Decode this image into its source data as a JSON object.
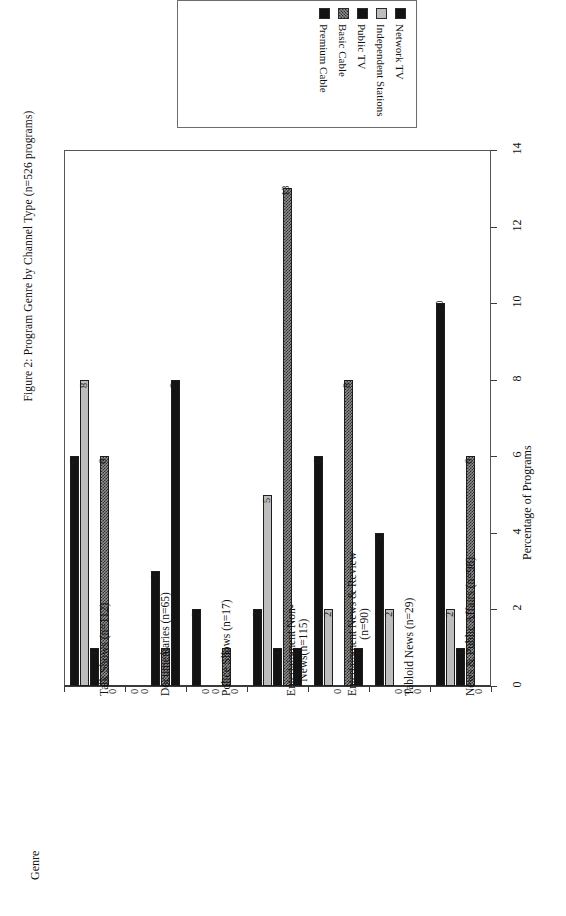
{
  "figure": {
    "title": "Figure 2: Program Genre by Channel Type (n=526 programs)"
  },
  "chart_data": {
    "type": "bar",
    "title": "Figure 2: Program Genre by Channel Type (n=526 programs)",
    "orientation": "vertical-bars-rotated-page",
    "xlabel": "Genre",
    "ylabel": "Percentage of Programs",
    "ylim": [
      0,
      14
    ],
    "yticks": [
      0,
      2,
      4,
      6,
      8,
      10,
      12,
      14
    ],
    "ytick_labels": [
      "0",
      "2",
      "4",
      "6",
      "8",
      "10",
      "12",
      "14"
    ],
    "grid": false,
    "legend_position": "top",
    "categories": [
      "Talk Shows (n=112)",
      "Documentaries (n=65)",
      "Police Shows (n=17)",
      "Entertainment Non-News(n=115)",
      "Entertainment News & Review (n=90)",
      "Tabloid News (n=29)",
      "News & Public Affairs (n=98)"
    ],
    "category_lines": [
      [
        "Talk Shows (n=112)"
      ],
      [
        "Documentaries (n=65)"
      ],
      [
        "Police Shows (n=17)"
      ],
      [
        "Entertainment Non-",
        "News(n=115)"
      ],
      [
        "Entertainment News & Review",
        "(n=90)"
      ],
      [
        "Tabloid News (n=29)"
      ],
      [
        "News & Public Affairs (n=98)"
      ]
    ],
    "series": [
      {
        "name": "Network TV",
        "fill": "black",
        "color": "#131313",
        "values": [
          6,
          0,
          2,
          2,
          6,
          4,
          10
        ]
      },
      {
        "name": "Independent Stations",
        "fill": "light-gray",
        "color": "#bdbdbd",
        "values": [
          8,
          0,
          0,
          5,
          2,
          2,
          2
        ]
      },
      {
        "name": "Public TV",
        "fill": "black",
        "color": "#131313",
        "values": [
          1,
          3,
          0,
          1,
          0,
          0,
          1
        ]
      },
      {
        "name": "Basic Cable",
        "fill": "checker",
        "color": "#8f8f8f",
        "values": [
          6,
          1,
          1,
          13,
          8,
          0,
          6
        ]
      },
      {
        "name": "Premium Cable",
        "fill": "black",
        "color": "#131313",
        "values": [
          0,
          8,
          0,
          1,
          1,
          0,
          0
        ]
      }
    ]
  },
  "legend": {
    "items": [
      {
        "label": "Network TV",
        "swatch": "sw-black"
      },
      {
        "label": "Independent Stations",
        "swatch": "sw-lgray"
      },
      {
        "label": "Public TV",
        "swatch": "sw-black"
      },
      {
        "label": "Basic Cable",
        "swatch": "sw-check"
      },
      {
        "label": "Premium Cable",
        "swatch": "sw-black"
      }
    ]
  }
}
